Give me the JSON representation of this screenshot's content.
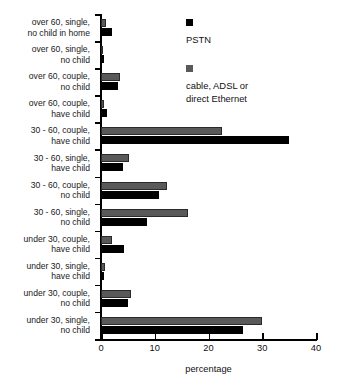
{
  "chart_data": {
    "type": "bar",
    "orientation": "horizontal",
    "title": "",
    "xlabel": "percentage",
    "ylabel": "",
    "xlim": [
      0,
      40
    ],
    "xticks": [
      0,
      10,
      20,
      30,
      40
    ],
    "grid": false,
    "legend_position": "top-right",
    "categories": [
      "over 60, single, no child in home",
      "over 60, single, no child",
      "over 60, couple, no child",
      "over 60, couple, have child",
      "30 - 60, couple, have child",
      "30 - 60, single, have child",
      "30 - 60, couple, no child",
      "30 - 60, single, no child",
      "under 30, couple, have child",
      "under 30, single, have child",
      "under 30, couple, no child",
      "under 30, single, no child"
    ],
    "category_lines": [
      [
        "over 60, single,",
        "no child in home"
      ],
      [
        "over 60, single,",
        "no child"
      ],
      [
        "over 60, couple,",
        "no child"
      ],
      [
        "over 60, couple,",
        "have child"
      ],
      [
        "30 - 60, couple,",
        "have child"
      ],
      [
        "30 - 60, single,",
        "have child"
      ],
      [
        "30 - 60, couple,",
        "no child"
      ],
      [
        "30 - 60, single,",
        "no child"
      ],
      [
        "under 30, couple,",
        "have child"
      ],
      [
        "under 30, single,",
        "have child"
      ],
      [
        "under 30, couple,",
        "no child"
      ],
      [
        "under 30, single,",
        "no child"
      ]
    ],
    "series": [
      {
        "name": "cable, ADSL or direct Ethernet",
        "color": "#595959",
        "values": [
          1.0,
          0.4,
          3.6,
          0.5,
          22.6,
          5.2,
          12.3,
          16.2,
          2.0,
          0.8,
          5.5,
          30.0
        ]
      },
      {
        "name": "PSTN",
        "color": "#000000",
        "values": [
          2.0,
          0.5,
          3.2,
          1.1,
          34.9,
          4.0,
          10.7,
          8.5,
          4.3,
          0.6,
          5.0,
          26.4
        ]
      }
    ]
  },
  "legend": {
    "items": [
      {
        "label": "PSTN",
        "lines": [
          "PSTN"
        ],
        "swatch": "black"
      },
      {
        "label": "cable, ADSL or direct Ethernet",
        "lines": [
          "cable, ADSL or",
          "direct Ethernet"
        ],
        "swatch": "gray"
      }
    ]
  },
  "axis": {
    "x_title": "percentage",
    "x_tick_labels": [
      "0",
      "10",
      "20",
      "30",
      "40"
    ]
  }
}
